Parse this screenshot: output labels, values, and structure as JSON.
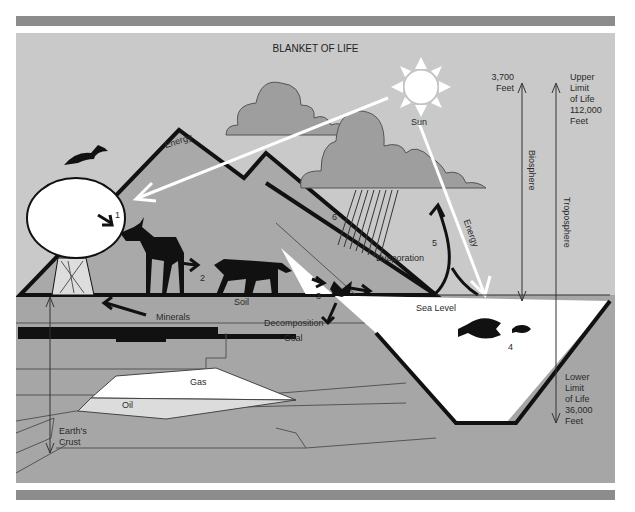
{
  "title": "BLANKET OF LIFE",
  "labels": {
    "sun": "Sun",
    "energy_left": "Energy",
    "energy_right": "Energy",
    "evaporation": "Evaporation",
    "sea_level": "Sea Level",
    "soil": "Soil",
    "minerals": "Minerals",
    "decomposition": "Decomposition",
    "coal": "Coal",
    "gas": "Gas",
    "oil": "Oil",
    "earths_crust_line1": "Earth's",
    "earths_crust_line2": "Crust",
    "biosphere": "Biosphere",
    "troposphere": "Troposphere"
  },
  "altitudes": {
    "biosphere_top_line1": "3,700",
    "biosphere_top_line2": "Feet",
    "upper_limit": [
      "Upper",
      "Limit",
      "of Life",
      "112,000",
      "Feet"
    ],
    "lower_limit": [
      "Lower",
      "Limit",
      "of Life",
      "36,000",
      "Feet"
    ]
  },
  "steps": {
    "s1": "1",
    "s2": "2",
    "s3": "3",
    "s4": "4",
    "s5": "5",
    "s6": "6"
  },
  "colors": {
    "background": "#c9c9c9",
    "mountain": "#a9a9a9",
    "cloud": "#9e9e9e",
    "underground": "#a6a6a6",
    "ink": "#111111",
    "water": "#ffffff",
    "frame_bar": "#8c8c8c"
  }
}
